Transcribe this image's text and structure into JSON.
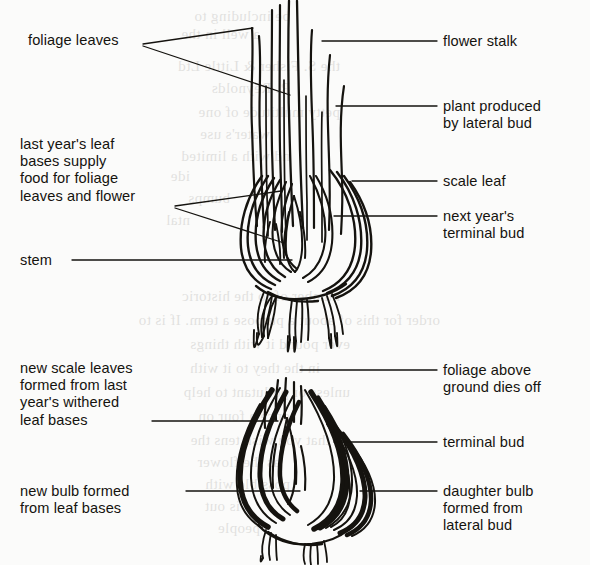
{
  "page": {
    "background_color": "#fbfbfa",
    "ink_color": "#15130f",
    "width": 590,
    "height": 565
  },
  "diagram": {
    "type": "botanical-line-diagram",
    "subject": "bulb",
    "figures": [
      {
        "name": "upper-bulb",
        "caption": "bulb in growing season with foliage leaves and flower stalk"
      },
      {
        "name": "lower-bulb",
        "caption": "bulb after foliage dies down, new bulb and daughter bulb formed"
      }
    ]
  },
  "labels": {
    "upper_left": [
      {
        "id": "foliage-leaves",
        "text": "foliage leaves",
        "x": 28,
        "y": 32,
        "align": "left"
      },
      {
        "id": "last-years-leaf-bases",
        "text": "last year's leaf\nbases supply\nfood for foliage\nleaves and flower",
        "x": 20,
        "y": 136,
        "align": "left"
      },
      {
        "id": "stem",
        "text": "stem",
        "x": 20,
        "y": 252,
        "align": "left"
      }
    ],
    "upper_right": [
      {
        "id": "flower-stalk",
        "text": "flower stalk",
        "x": 443,
        "y": 33,
        "align": "left"
      },
      {
        "id": "plant-produced-by-lateral-bud",
        "text": "plant produced\nby lateral bud",
        "x": 443,
        "y": 98,
        "align": "left"
      },
      {
        "id": "scale-leaf",
        "text": "scale leaf",
        "x": 443,
        "y": 173,
        "align": "left"
      },
      {
        "id": "next-years-terminal-bud",
        "text": "next year's\nterminal bud",
        "x": 443,
        "y": 208,
        "align": "left"
      }
    ],
    "lower_left": [
      {
        "id": "new-scale-leaves",
        "text": "new scale leaves\nformed from last\nyear's withered\nleaf bases",
        "x": 20,
        "y": 360,
        "align": "left"
      },
      {
        "id": "new-bulb-formed",
        "text": "new bulb formed\nfrom leaf bases",
        "x": 20,
        "y": 483,
        "align": "left"
      }
    ],
    "lower_right": [
      {
        "id": "foliage-above-ground-dies-off",
        "text": "foliage above\nground dies off",
        "x": 443,
        "y": 362,
        "align": "left"
      },
      {
        "id": "terminal-bud",
        "text": "terminal bud",
        "x": 443,
        "y": 434,
        "align": "left"
      },
      {
        "id": "daughter-bulb",
        "text": "daughter bulb\nformed from\nlateral bud",
        "x": 443,
        "y": 483,
        "align": "left"
      }
    ]
  },
  "bleed_through": {
    "description": "faint mirrored text showing through from the reverse side of the printed page",
    "lines": [
      {
        "text": "be including to",
        "x": 300,
        "y": 8
      },
      {
        "text": "a well in the",
        "x": 330,
        "y": 26
      },
      {
        "text": "the S. Fisher & Little Ltd",
        "x": 250,
        "y": 58
      },
      {
        "text": "R. Reynolds",
        "x": 300,
        "y": 80
      },
      {
        "text": "petty multitude of one",
        "x": 250,
        "y": 104
      },
      {
        "text": "water's use",
        "x": 320,
        "y": 126
      },
      {
        "text": "nd with a limited",
        "x": 300,
        "y": 148
      },
      {
        "text": "ide",
        "x": 400,
        "y": 168
      },
      {
        "text": "bumps",
        "x": 360,
        "y": 190
      },
      {
        "text": "ntal",
        "x": 400,
        "y": 212
      },
      {
        "text": "number of to the historic",
        "x": 250,
        "y": 288
      },
      {
        "text": "order for this of about a purpose a term. If is to",
        "x": 150,
        "y": 312
      },
      {
        "text": "ever pound it with things",
        "x": 240,
        "y": 336
      },
      {
        "text": "in the they to it with",
        "x": 270,
        "y": 360
      },
      {
        "text": "unless or pollutant to help",
        "x": 240,
        "y": 384
      },
      {
        "text": "once a four on",
        "x": 300,
        "y": 408
      },
      {
        "text": "that you wish tens the",
        "x": 260,
        "y": 432
      },
      {
        "text": "as the flower",
        "x": 310,
        "y": 454
      },
      {
        "text": "possible with",
        "x": 300,
        "y": 476
      },
      {
        "text": "is out",
        "x": 350,
        "y": 498
      },
      {
        "text": "people",
        "x": 330,
        "y": 520
      }
    ]
  }
}
